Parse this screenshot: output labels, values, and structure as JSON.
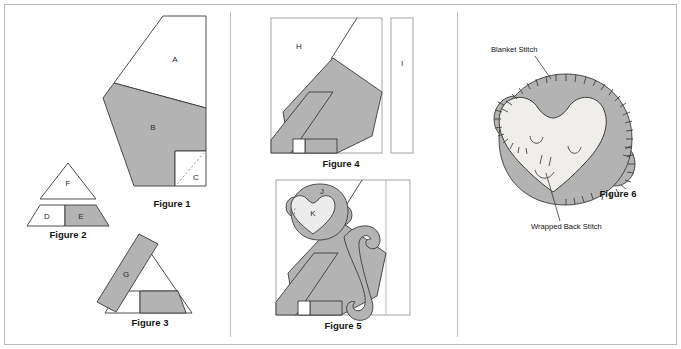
{
  "page": {
    "width": 681,
    "height": 349,
    "background_color": "#ffffff",
    "border_color": "#b9b9b9"
  },
  "colors": {
    "fabric_gray": "#b3b3b3",
    "background_white": "#ffffff",
    "outline": "#3a3a3a",
    "frame": "#b9b9b9",
    "face_cream": "#f0eeea",
    "dashed": "#8a8a8a"
  },
  "panels": [
    {
      "id": "panel-left",
      "divider_x": 230
    },
    {
      "id": "panel-middle",
      "divider_x": 457
    },
    {
      "id": "panel-right",
      "divider_x": null
    }
  ],
  "figures": [
    {
      "id": "figure-1",
      "caption": "Figure 1",
      "pieces": [
        {
          "label": "A",
          "fill": "white"
        },
        {
          "label": "B",
          "fill": "gray"
        },
        {
          "label": "C",
          "fill": "white",
          "has_dashed_diagonal": true
        }
      ]
    },
    {
      "id": "figure-2",
      "caption": "Figure 2",
      "pieces": [
        {
          "label": "F",
          "fill": "white"
        },
        {
          "label": "D",
          "fill": "white"
        },
        {
          "label": "E",
          "fill": "gray"
        }
      ]
    },
    {
      "id": "figure-3",
      "caption": "Figure 3",
      "pieces": [
        {
          "label": "G",
          "fill": "gray"
        }
      ]
    },
    {
      "id": "figure-4",
      "caption": "Figure 4",
      "pieces": [
        {
          "label": "H",
          "fill": "white"
        },
        {
          "label": "I",
          "fill": "white"
        }
      ]
    },
    {
      "id": "figure-5",
      "caption": "Figure 5",
      "pieces": [
        {
          "label": "J",
          "fill": "gray"
        },
        {
          "label": "K",
          "fill": "cream"
        }
      ]
    },
    {
      "id": "figure-6",
      "caption": "Figure 6",
      "pieces": []
    }
  ],
  "annotations": [
    {
      "id": "blanket-stitch",
      "text": "Blanket Stitch",
      "text_x": 491,
      "text_y": 52,
      "leader_from": [
        535,
        56
      ],
      "leader_to": [
        551,
        79
      ]
    },
    {
      "id": "wrapped-back-stitch",
      "text": "Wrapped Back Stitch",
      "text_x": 531,
      "text_y": 229,
      "leader_from": [
        560,
        221
      ],
      "leader_to": [
        546,
        173
      ]
    }
  ],
  "captions": {
    "figure_1": "Figure 1",
    "figure_2": "Figure 2",
    "figure_3": "Figure 3",
    "figure_4": "Figure 4",
    "figure_5": "Figure 5",
    "figure_6": "Figure 6"
  },
  "piece_labels": {
    "a": "A",
    "b": "B",
    "c": "C",
    "d": "D",
    "e": "E",
    "f": "F",
    "g": "G",
    "h": "H",
    "i": "I",
    "j": "J",
    "k": "K"
  }
}
